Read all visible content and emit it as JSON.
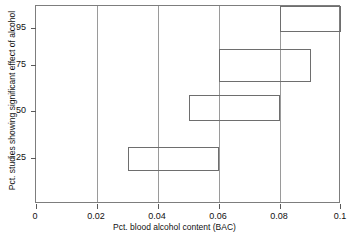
{
  "chart_data": {
    "type": "bar",
    "orientation": "horizontal-range",
    "title": "",
    "xlabel": "Pct. blood alcohol content (BAC)",
    "ylabel": "Pct. studies showing significant effect of alcohol",
    "xlim": [
      0,
      0.1
    ],
    "ylim": [
      0,
      107
    ],
    "grid": "vertical",
    "legend": "none",
    "xticks": [
      0,
      0.02,
      0.04,
      0.06,
      0.08,
      0.1
    ],
    "xtick_labels": [
      "0",
      "0.02",
      "0.04",
      "0.06",
      "0.08",
      "0.1"
    ],
    "yticks": [
      25,
      50,
      75,
      95
    ],
    "ytick_labels": [
      "25",
      "50",
      "75",
      "95"
    ],
    "bars": [
      {
        "name": "bar-95",
        "x_start": 0.08,
        "x_end": 0.1,
        "y_low": 93,
        "y_high": 107
      },
      {
        "name": "bar-75",
        "x_start": 0.06,
        "x_end": 0.09,
        "y_low": 66,
        "y_high": 84
      },
      {
        "name": "bar-50",
        "x_start": 0.05,
        "x_end": 0.08,
        "y_low": 45,
        "y_high": 59
      },
      {
        "name": "bar-25",
        "x_start": 0.03,
        "x_end": 0.06,
        "y_low": 18,
        "y_high": 31
      }
    ]
  },
  "axes": {
    "x_title": "Pct. blood alcohol content (BAC)",
    "y_title": "Pct. studies showing significant effect of alcohol",
    "x_tick_labels": [
      "0",
      "0.02",
      "0.04",
      "0.06",
      "0.08",
      "0.1"
    ],
    "y_tick_labels": [
      "25",
      "50",
      "75",
      "95"
    ]
  },
  "colors": {
    "bar_outline": "#6e6e6e",
    "frame": "#7d7d7d",
    "gridline": "#9a9a9a",
    "text": "#111111",
    "background": "#ffffff"
  }
}
